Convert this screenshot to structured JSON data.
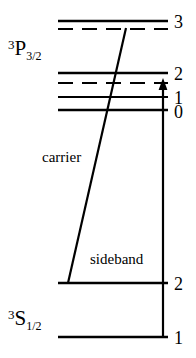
{
  "figure": {
    "kind": "atomic-energy-level-diagram",
    "width": 196,
    "height": 358,
    "background_color": "#ffffff",
    "line_color": "#000000"
  },
  "terms": [
    {
      "id": "upper-term",
      "pre_superscript": "3",
      "letter": "P",
      "subscript": "3/2",
      "x": 8,
      "y": 38
    },
    {
      "id": "lower-term",
      "pre_superscript": "3",
      "letter": "S",
      "subscript": "1/2",
      "x": 8,
      "y": 308
    }
  ],
  "levels": [
    {
      "id": "p32-f3",
      "label": "3",
      "style": "solid",
      "y": 21,
      "x1": 58,
      "x2": 168
    },
    {
      "id": "p32-f3-dash",
      "label": "",
      "style": "dashed",
      "y": 29,
      "x1": 58,
      "x2": 168
    },
    {
      "id": "p32-f2",
      "label": "2",
      "style": "solid",
      "y": 73,
      "x1": 58,
      "x2": 168
    },
    {
      "id": "p32-f2-dash",
      "label": "",
      "style": "dashed",
      "y": 83,
      "x1": 58,
      "x2": 168
    },
    {
      "id": "p32-f1",
      "label": "1",
      "style": "solid",
      "y": 97,
      "x1": 58,
      "x2": 168
    },
    {
      "id": "p32-f0",
      "label": "0",
      "style": "solid",
      "y": 110,
      "x1": 58,
      "x2": 168
    },
    {
      "id": "s12-f2",
      "label": "2",
      "style": "solid",
      "y": 283,
      "x1": 58,
      "x2": 168
    },
    {
      "id": "s12-f1",
      "label": "1",
      "style": "solid",
      "y": 337,
      "x1": 58,
      "x2": 168
    }
  ],
  "level_numbers": [
    {
      "text": "3",
      "x": 174,
      "y": 13
    },
    {
      "text": "2",
      "x": 174,
      "y": 65
    },
    {
      "text": "1",
      "x": 174,
      "y": 89
    },
    {
      "text": "0",
      "x": 174,
      "y": 103
    },
    {
      "text": "2",
      "x": 174,
      "y": 275
    },
    {
      "text": "1",
      "x": 174,
      "y": 329
    }
  ],
  "transitions": [
    {
      "id": "carrier-transition",
      "label": "carrier",
      "type": "diagonal-line",
      "x1": 68,
      "y1": 283,
      "x2": 126,
      "y2": 28,
      "label_x": 42,
      "label_y": 150
    },
    {
      "id": "sideband-transition",
      "label": "sideband",
      "type": "vertical-arrow",
      "x1": 163,
      "y1": 337,
      "x2": 163,
      "y2": 82,
      "arrowhead": "up",
      "label_x": 90,
      "label_y": 252
    }
  ]
}
